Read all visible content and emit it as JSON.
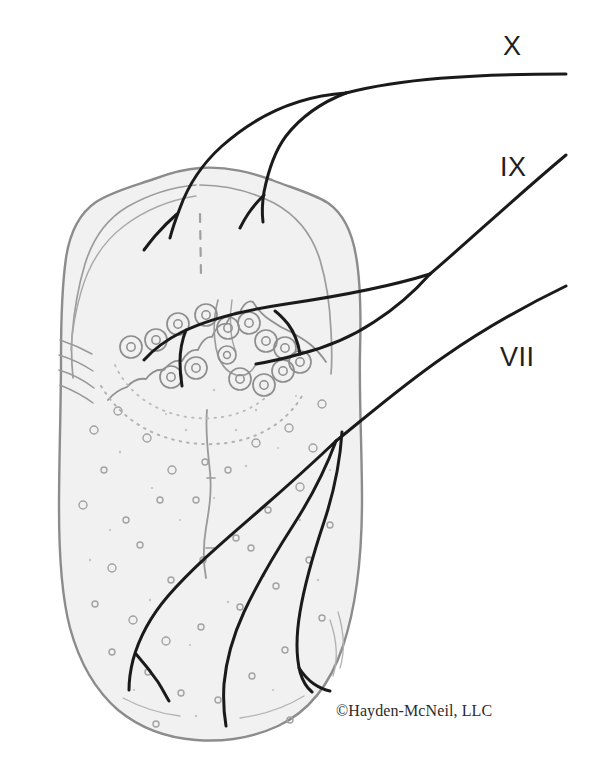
{
  "figure": {
    "background_color": "#ffffff"
  },
  "labels": {
    "vagus": "X",
    "glossopharyngeal": "IX",
    "facial": "VII"
  },
  "copyright": {
    "text": "©Hayden-McNeil, LLC"
  },
  "colors": {
    "nerve_line": "#1a1a1a",
    "outline": "#8c8c8c",
    "inner_contour": "#9a9a9a",
    "tongue_fill": "#f1f1f1",
    "papilla_ring": "#8e8e8e",
    "dot": "#a2a2a2",
    "label_text": "#231f20",
    "copyright_text": "#2b2b2b"
  },
  "anatomy": {
    "circumvallate_papillae": [
      {
        "cx": 131,
        "cy": 347,
        "r": 11
      },
      {
        "cx": 156,
        "cy": 340,
        "r": 11
      },
      {
        "cx": 178,
        "cy": 324,
        "r": 11
      },
      {
        "cx": 206,
        "cy": 315,
        "r": 11
      },
      {
        "cx": 228,
        "cy": 328,
        "r": 11
      },
      {
        "cx": 249,
        "cy": 323,
        "r": 11
      },
      {
        "cx": 266,
        "cy": 341,
        "r": 11
      },
      {
        "cx": 285,
        "cy": 348,
        "r": 11
      },
      {
        "cx": 300,
        "cy": 362,
        "r": 11
      },
      {
        "cx": 171,
        "cy": 377,
        "r": 11
      },
      {
        "cx": 196,
        "cy": 368,
        "r": 11
      },
      {
        "cx": 240,
        "cy": 379,
        "r": 11
      },
      {
        "cx": 264,
        "cy": 385,
        "r": 11
      },
      {
        "cx": 283,
        "cy": 371,
        "r": 11
      },
      {
        "cx": 227,
        "cy": 355,
        "r": 9
      }
    ],
    "fungiform_papillae": [
      {
        "cx": 94,
        "cy": 430,
        "r": 4
      },
      {
        "cx": 118,
        "cy": 411,
        "r": 4
      },
      {
        "cx": 147,
        "cy": 438,
        "r": 4
      },
      {
        "cx": 172,
        "cy": 470,
        "r": 4
      },
      {
        "cx": 104,
        "cy": 470,
        "r": 3
      },
      {
        "cx": 83,
        "cy": 505,
        "r": 4
      },
      {
        "cx": 126,
        "cy": 520,
        "r": 3
      },
      {
        "cx": 160,
        "cy": 500,
        "r": 3
      },
      {
        "cx": 196,
        "cy": 500,
        "r": 3
      },
      {
        "cx": 228,
        "cy": 470,
        "r": 3
      },
      {
        "cx": 256,
        "cy": 443,
        "r": 4
      },
      {
        "cx": 289,
        "cy": 428,
        "r": 4
      },
      {
        "cx": 313,
        "cy": 448,
        "r": 4
      },
      {
        "cx": 322,
        "cy": 404,
        "r": 4
      },
      {
        "cx": 300,
        "cy": 487,
        "r": 4
      },
      {
        "cx": 268,
        "cy": 510,
        "r": 3
      },
      {
        "cx": 236,
        "cy": 538,
        "r": 3
      },
      {
        "cx": 203,
        "cy": 560,
        "r": 3
      },
      {
        "cx": 171,
        "cy": 580,
        "r": 3
      },
      {
        "cx": 140,
        "cy": 545,
        "r": 3
      },
      {
        "cx": 112,
        "cy": 568,
        "r": 4
      },
      {
        "cx": 95,
        "cy": 604,
        "r": 3
      },
      {
        "cx": 133,
        "cy": 620,
        "r": 4
      },
      {
        "cx": 166,
        "cy": 641,
        "r": 4
      },
      {
        "cx": 201,
        "cy": 627,
        "r": 3
      },
      {
        "cx": 240,
        "cy": 607,
        "r": 3
      },
      {
        "cx": 276,
        "cy": 586,
        "r": 3
      },
      {
        "cx": 309,
        "cy": 560,
        "r": 3
      },
      {
        "cx": 330,
        "cy": 525,
        "r": 3
      },
      {
        "cx": 322,
        "cy": 618,
        "r": 3
      },
      {
        "cx": 285,
        "cy": 650,
        "r": 3
      },
      {
        "cx": 252,
        "cy": 676,
        "r": 3
      },
      {
        "cx": 218,
        "cy": 700,
        "r": 3
      },
      {
        "cx": 181,
        "cy": 693,
        "r": 3
      },
      {
        "cx": 148,
        "cy": 672,
        "r": 3
      },
      {
        "cx": 112,
        "cy": 652,
        "r": 3
      },
      {
        "cx": 205,
        "cy": 462,
        "r": 3
      },
      {
        "cx": 251,
        "cy": 548,
        "r": 3
      },
      {
        "cx": 290,
        "cy": 720,
        "r": 3
      },
      {
        "cx": 156,
        "cy": 724,
        "r": 3
      }
    ]
  }
}
